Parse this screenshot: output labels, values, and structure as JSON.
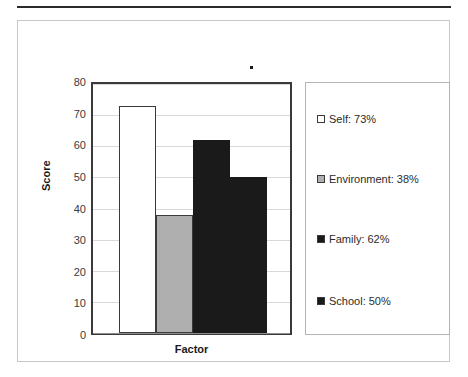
{
  "figure": {
    "stray_mark": "stray-dot-artifact"
  },
  "chart_data": {
    "type": "bar",
    "title": "",
    "xlabel": "Factor",
    "ylabel": "Score",
    "categories": [
      "Self",
      "Environment",
      "Family",
      "School"
    ],
    "values": [
      73,
      38,
      62,
      50
    ],
    "ylim": [
      0,
      80
    ],
    "yticks": [
      0,
      10,
      20,
      30,
      40,
      50,
      60,
      70,
      80
    ],
    "ytick_labels": [
      "0",
      "10",
      "20",
      "30",
      "40",
      "50",
      "60",
      "70",
      "80"
    ],
    "grid": true,
    "legend_position": "right",
    "legend": [
      {
        "label": "Self: 73%",
        "color": "#ffffff",
        "swatch": "legend-swatch-self"
      },
      {
        "label": "Environment: 38%",
        "color": "#afafaf",
        "swatch": "legend-swatch-environment"
      },
      {
        "label": "Family: 62%",
        "color": "#1a1a1a",
        "swatch": "legend-swatch-family"
      },
      {
        "label": "School: 50%",
        "color": "#1a1a1a",
        "swatch": "legend-swatch-school"
      }
    ],
    "series": [
      {
        "name": "Self",
        "value": 73,
        "percent": "73%",
        "color": "#ffffff"
      },
      {
        "name": "Environment",
        "value": 38,
        "percent": "38%",
        "color": "#afafaf"
      },
      {
        "name": "Family",
        "value": 62,
        "percent": "62%",
        "color": "#1a1a1a"
      },
      {
        "name": "School",
        "value": 50,
        "percent": "50%",
        "color": "#1a1a1a"
      }
    ]
  },
  "colors": {
    "bar_white": "#ffffff",
    "bar_gray": "#afafaf",
    "bar_dark": "#1a1a1a",
    "axis": "#3a3a3a",
    "grid": "#d9d9d9",
    "frame": "#c8c8c8"
  }
}
